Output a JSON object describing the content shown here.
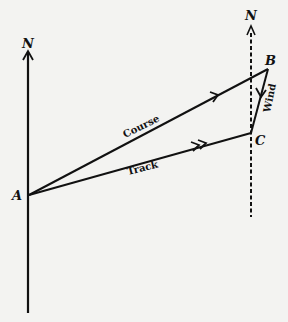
{
  "diagram": {
    "labels": {
      "north_left": "N",
      "north_right": "N",
      "point_a": "A",
      "point_b": "B",
      "point_c": "C",
      "course": "Course",
      "track": "Track",
      "wind": "Wind"
    },
    "colors": {
      "ink": "#111111",
      "paper": "#f3f3f1"
    }
  }
}
